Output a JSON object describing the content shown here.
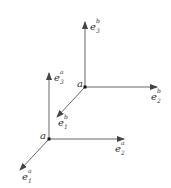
{
  "diagram": {
    "title": "",
    "frames": [
      {
        "name": "a",
        "origin_label": "a",
        "axes": [
          {
            "base": "e",
            "sup": "a",
            "sub": "1"
          },
          {
            "base": "e",
            "sup": "a",
            "sub": "2"
          },
          {
            "base": "e",
            "sup": "a",
            "sub": "3"
          }
        ]
      },
      {
        "name": "b",
        "origin_label": "a",
        "axes": [
          {
            "base": "e",
            "sup": "b",
            "sub": "1"
          },
          {
            "base": "e",
            "sup": "b",
            "sub": "2"
          },
          {
            "base": "e",
            "sup": "b",
            "sub": "3"
          }
        ]
      }
    ],
    "colors": {
      "line": "#444444",
      "text": "#333333"
    }
  }
}
